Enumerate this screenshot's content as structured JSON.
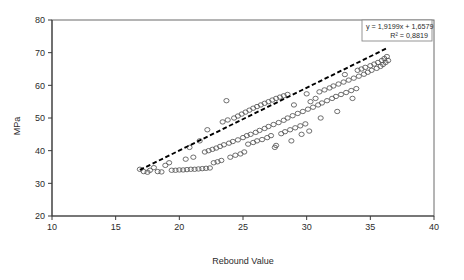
{
  "chart_data": {
    "type": "scatter",
    "title": "",
    "subtitle": "",
    "xlabel": "Rebound Value",
    "ylabel": "MPa",
    "xlim": [
      10,
      40
    ],
    "ylim": [
      20,
      80
    ],
    "xticks": [
      10,
      15,
      20,
      25,
      30,
      35,
      40
    ],
    "xtick_labels": [
      "10",
      "15",
      "20",
      "25",
      "30",
      "35",
      "40"
    ],
    "yticks": [
      20,
      30,
      40,
      50,
      60,
      70,
      80
    ],
    "ytick_labels": [
      "20",
      "30",
      "40",
      "50",
      "60",
      "70",
      "80"
    ],
    "grid": false,
    "legend_position": "none",
    "marker": "open-circle",
    "annotations": {
      "equation": "y = 1,9199x + 1,6579",
      "r_squared": "R² = 0,8819"
    },
    "trendline": {
      "type": "linear",
      "slope": 1.9199,
      "intercept": 1.6579,
      "r2": 0.8819,
      "style": "dashed",
      "x_start": 16.9,
      "x_end": 36.4
    },
    "series": [
      {
        "name": "Rebound vs MPa",
        "points": [
          [
            16.9,
            34.3
          ],
          [
            17.2,
            33.6
          ],
          [
            17.5,
            33.4
          ],
          [
            17.7,
            34.0
          ],
          [
            18.0,
            34.8
          ],
          [
            18.3,
            33.6
          ],
          [
            18.6,
            33.5
          ],
          [
            18.9,
            35.5
          ],
          [
            19.2,
            36.3
          ],
          [
            19.4,
            34.0
          ],
          [
            19.7,
            34.0
          ],
          [
            20.0,
            34.1
          ],
          [
            20.3,
            34.1
          ],
          [
            20.5,
            37.4
          ],
          [
            20.6,
            34.2
          ],
          [
            20.9,
            34.3
          ],
          [
            21.1,
            38.0
          ],
          [
            21.2,
            34.3
          ],
          [
            21.5,
            34.4
          ],
          [
            21.8,
            34.5
          ],
          [
            22.0,
            39.6
          ],
          [
            22.1,
            34.6
          ],
          [
            22.3,
            40.0
          ],
          [
            22.4,
            34.7
          ],
          [
            22.6,
            40.4
          ],
          [
            22.7,
            36.3
          ],
          [
            22.9,
            40.8
          ],
          [
            23.0,
            36.6
          ],
          [
            23.2,
            41.3
          ],
          [
            23.3,
            37.0
          ],
          [
            23.5,
            41.8
          ],
          [
            23.7,
            55.3
          ],
          [
            23.9,
            42.3
          ],
          [
            24.0,
            38.0
          ],
          [
            24.2,
            42.8
          ],
          [
            24.4,
            38.6
          ],
          [
            24.6,
            43.3
          ],
          [
            24.8,
            39.0
          ],
          [
            25.0,
            44.0
          ],
          [
            25.1,
            39.6
          ],
          [
            25.3,
            44.6
          ],
          [
            25.4,
            42.0
          ],
          [
            25.6,
            45.0
          ],
          [
            25.8,
            42.5
          ],
          [
            26.0,
            45.6
          ],
          [
            26.1,
            43.0
          ],
          [
            26.3,
            46.2
          ],
          [
            26.5,
            43.4
          ],
          [
            26.7,
            46.8
          ],
          [
            26.9,
            44.0
          ],
          [
            27.0,
            47.4
          ],
          [
            27.2,
            44.6
          ],
          [
            27.4,
            48.0
          ],
          [
            27.6,
            41.6
          ],
          [
            27.8,
            48.6
          ],
          [
            28.0,
            45.2
          ],
          [
            28.2,
            49.3
          ],
          [
            28.3,
            45.8
          ],
          [
            28.5,
            50.0
          ],
          [
            28.7,
            46.4
          ],
          [
            28.9,
            50.7
          ],
          [
            29.0,
            54.0
          ],
          [
            29.1,
            47.0
          ],
          [
            29.3,
            51.4
          ],
          [
            29.5,
            47.6
          ],
          [
            29.7,
            52.0
          ],
          [
            29.9,
            48.2
          ],
          [
            30.0,
            57.4
          ],
          [
            30.1,
            52.7
          ],
          [
            30.3,
            55.0
          ],
          [
            30.5,
            53.3
          ],
          [
            30.7,
            56.0
          ],
          [
            30.9,
            54.0
          ],
          [
            31.0,
            58.0
          ],
          [
            31.2,
            54.6
          ],
          [
            31.4,
            58.6
          ],
          [
            31.6,
            55.3
          ],
          [
            31.8,
            59.2
          ],
          [
            32.0,
            56.0
          ],
          [
            32.1,
            59.8
          ],
          [
            32.3,
            56.6
          ],
          [
            32.5,
            60.4
          ],
          [
            32.7,
            57.2
          ],
          [
            32.9,
            61.0
          ],
          [
            33.0,
            63.3
          ],
          [
            33.1,
            57.8
          ],
          [
            33.3,
            61.6
          ],
          [
            33.5,
            58.4
          ],
          [
            33.7,
            62.2
          ],
          [
            33.9,
            59.0
          ],
          [
            34.0,
            64.6
          ],
          [
            34.1,
            62.8
          ],
          [
            34.3,
            65.0
          ],
          [
            34.5,
            63.4
          ],
          [
            34.6,
            65.5
          ],
          [
            34.8,
            64.0
          ],
          [
            35.0,
            66.0
          ],
          [
            35.1,
            64.6
          ],
          [
            35.3,
            66.5
          ],
          [
            35.5,
            65.2
          ],
          [
            35.6,
            67.0
          ],
          [
            35.8,
            65.8
          ],
          [
            35.9,
            67.6
          ],
          [
            36.0,
            66.4
          ],
          [
            36.1,
            68.2
          ],
          [
            36.2,
            67.0
          ],
          [
            36.3,
            68.8
          ],
          [
            36.4,
            67.6
          ],
          [
            24.3,
            50.0
          ],
          [
            24.6,
            50.6
          ],
          [
            24.9,
            51.2
          ],
          [
            25.2,
            51.8
          ],
          [
            25.5,
            52.4
          ],
          [
            25.8,
            53.0
          ],
          [
            26.1,
            53.5
          ],
          [
            26.4,
            54.0
          ],
          [
            26.7,
            54.5
          ],
          [
            27.0,
            55.0
          ],
          [
            27.3,
            55.5
          ],
          [
            27.6,
            56.0
          ],
          [
            27.9,
            56.4
          ],
          [
            28.2,
            56.8
          ],
          [
            28.5,
            57.2
          ],
          [
            23.8,
            49.4
          ],
          [
            23.4,
            48.8
          ],
          [
            29.6,
            45.0
          ],
          [
            30.2,
            46.0
          ],
          [
            27.5,
            41.0
          ],
          [
            28.8,
            43.0
          ],
          [
            22.2,
            46.4
          ],
          [
            21.6,
            43.0
          ],
          [
            20.8,
            41.0
          ],
          [
            32.4,
            52.0
          ],
          [
            33.6,
            56.0
          ],
          [
            31.1,
            50.0
          ]
        ]
      }
    ]
  },
  "geometry": {
    "plot_left": 52,
    "plot_top": 20,
    "plot_right": 434,
    "plot_bottom": 216
  }
}
